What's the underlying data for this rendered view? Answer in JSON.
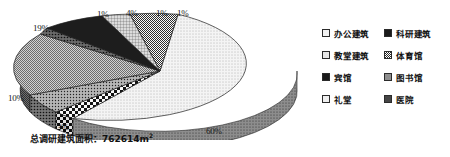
{
  "caption": {
    "text": "总调研建筑面积：762614m",
    "superscript": "2"
  },
  "legend": {
    "items": [
      {
        "label": "办公建筑",
        "swatch": "dot-light-swatch"
      },
      {
        "label": "科研建筑",
        "swatch": "dark-dot-swatch"
      },
      {
        "label": "教堂建筑",
        "swatch": "grid-swatch"
      },
      {
        "label": "体育馆",
        "swatch": "check-small-swatch"
      },
      {
        "label": "宾馆",
        "swatch": "solid-dark-swatch"
      },
      {
        "label": "图书馆",
        "swatch": "gray-hatch-swatch"
      },
      {
        "label": "礼堂",
        "swatch": "vline-swatch"
      },
      {
        "label": "医院",
        "swatch": "dot-med-swatch"
      }
    ]
  },
  "chart_data": {
    "type": "pie",
    "title": "",
    "subtitle": "",
    "annotations": [
      "总调研建筑面积：762614m2"
    ],
    "total_area_m2": 762614,
    "unit": "%",
    "three_d": true,
    "legend_position": "right",
    "grid": false,
    "labels_show_percent": true,
    "categories": [
      "办公建筑",
      "科研建筑",
      "教堂建筑",
      "体育馆",
      "宾馆",
      "图书馆",
      "礼堂",
      "医院"
    ],
    "values": [
      60,
      1,
      1,
      1,
      4,
      19,
      3,
      10
    ],
    "slices": [
      {
        "name": "办公建筑",
        "percent": 60,
        "label": "60%",
        "pattern": "dot-light",
        "label_pos": "bottom"
      },
      {
        "name": "科研建筑",
        "percent": 1,
        "label": "1%",
        "pattern": "dark-dot",
        "label_pos": "top-right"
      },
      {
        "name": "教堂建筑",
        "percent": 1,
        "label": "1%",
        "pattern": "grid",
        "label_pos": "top-right"
      },
      {
        "name": "体育馆",
        "percent": 1,
        "label": "1%",
        "pattern": "check-small",
        "label_pos": "top"
      },
      {
        "name": "宾馆",
        "percent": 4,
        "label": "4%",
        "pattern": "solid-dark",
        "label_pos": "top"
      },
      {
        "name": "图书馆",
        "percent": 19,
        "label": "19%",
        "pattern": "gray-hatch",
        "label_pos": "top-left"
      },
      {
        "name": "礼堂",
        "percent": 3,
        "label": "3%",
        "pattern": "vline",
        "label_pos": "bottom-left"
      },
      {
        "name": "医院",
        "percent": 10,
        "label": "10%",
        "pattern": "dot-med",
        "label_pos": "left"
      }
    ],
    "callouts": [
      {
        "value": "1%",
        "x": 97,
        "y": 9
      },
      {
        "value": "4%",
        "x": 126,
        "y": 8
      },
      {
        "value": "1%",
        "x": 156,
        "y": 8
      },
      {
        "value": "1%",
        "x": 177,
        "y": 8
      },
      {
        "value": "19%",
        "x": 33,
        "y": 23
      },
      {
        "value": "10%",
        "x": 8,
        "y": 93
      },
      {
        "value": "3%",
        "x": 57,
        "y": 122
      },
      {
        "value": "60%",
        "x": 206,
        "y": 126
      }
    ]
  }
}
